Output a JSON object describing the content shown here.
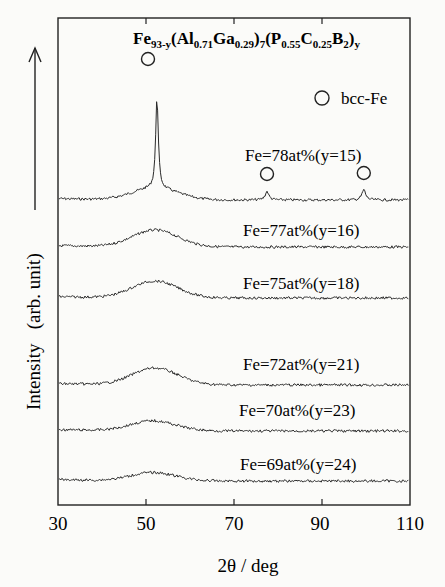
{
  "chart_data": {
    "type": "line",
    "title": "Fe93-y(Al0.71Ga0.29)7(P0.55C0.25B2)y",
    "title_parts": [
      {
        "t": "Fe",
        "sub": false
      },
      {
        "t": "93-y",
        "sub": true
      },
      {
        "t": "(Al",
        "sub": false
      },
      {
        "t": "0.71",
        "sub": true
      },
      {
        "t": "Ga",
        "sub": false
      },
      {
        "t": "0.29",
        "sub": true
      },
      {
        "t": ")",
        "sub": false
      },
      {
        "t": "7",
        "sub": true
      },
      {
        "t": "(P",
        "sub": false
      },
      {
        "t": "0.55",
        "sub": true
      },
      {
        "t": "C",
        "sub": false
      },
      {
        "t": "0.25",
        "sub": true
      },
      {
        "t": "B",
        "sub": false
      },
      {
        "t": "2",
        "sub": true
      },
      {
        "t": ")",
        "sub": false
      },
      {
        "t": "y",
        "sub": true
      }
    ],
    "xlabel": "2θ / deg",
    "ylabel": "Intensity   (arb. unit)",
    "xlim": [
      30,
      110
    ],
    "xticks": [
      30,
      50,
      70,
      90,
      110
    ],
    "grid": false,
    "legend": {
      "marker": "open-circle",
      "label": "bcc-Fe",
      "position": "upper-right"
    },
    "series": [
      {
        "name": "Fe=78at%(y=15)",
        "baseline_offset": 5,
        "amorphous_hump_center": 52,
        "amorphous_hump_height": 0.35,
        "crystalline_peaks": [
          {
            "two_theta": 52.5,
            "height": 2.7,
            "phase": "bcc-Fe"
          },
          {
            "two_theta": 77.5,
            "height": 0.25,
            "phase": "bcc-Fe"
          },
          {
            "two_theta": 99.5,
            "height": 0.3,
            "phase": "bcc-Fe"
          }
        ]
      },
      {
        "name": "Fe=77at%(y=16)",
        "baseline_offset": 4,
        "amorphous_hump_center": 52,
        "amorphous_hump_height": 0.5,
        "crystalline_peaks": []
      },
      {
        "name": "Fe=75at%(y=18)",
        "baseline_offset": 3,
        "amorphous_hump_center": 52,
        "amorphous_hump_height": 0.5,
        "crystalline_peaks": []
      },
      {
        "name": "Fe=72at%(y=21)",
        "baseline_offset": 2,
        "amorphous_hump_center": 52,
        "amorphous_hump_height": 0.5,
        "crystalline_peaks": []
      },
      {
        "name": "Fe=70at%(y=23)",
        "baseline_offset": 1,
        "amorphous_hump_center": 51.5,
        "amorphous_hump_height": 0.3,
        "crystalline_peaks": []
      },
      {
        "name": "Fe=69at%(y=24)",
        "baseline_offset": 0,
        "amorphous_hump_center": 51.5,
        "amorphous_hump_height": 0.25,
        "crystalline_peaks": []
      }
    ],
    "annotations": [
      {
        "type": "open-circle",
        "two_theta": 50,
        "series": "Fe=78at%(y=15)",
        "meaning": "bcc-Fe"
      },
      {
        "type": "open-circle",
        "two_theta": 77.5,
        "series": "Fe=78at%(y=15)",
        "meaning": "bcc-Fe"
      },
      {
        "type": "open-circle",
        "two_theta": 99.5,
        "series": "Fe=78at%(y=15)",
        "meaning": "bcc-Fe"
      }
    ]
  },
  "labels": {
    "xaxis": "2θ / deg",
    "yaxis": "Intensity   (arb. unit)",
    "legend": "bcc-Fe",
    "ticks": [
      "30",
      "50",
      "70",
      "90",
      "110"
    ],
    "curves": [
      "Fe=78at%(y=15)",
      "Fe=77at%(y=16)",
      "Fe=75at%(y=18)",
      "Fe=72at%(y=21)",
      "Fe=70at%(y=23)",
      "Fe=69at%(y=24)"
    ]
  },
  "colors": {
    "line": "#2a2a2a",
    "frame": "#222222",
    "background": "#fbfbf9"
  }
}
